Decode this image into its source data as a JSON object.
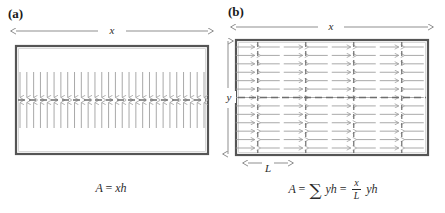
{
  "figure": {
    "type": "two-panel-schematic",
    "background_color": "#ffffff",
    "frame_color": "#555555",
    "arrow_color": "#8c8c8c",
    "dash_color": "#6e6e6e",
    "text_color": "#2b2b2b"
  },
  "panel_a": {
    "label": "(a)",
    "dimension_x_label": "x",
    "formula_A": "A",
    "formula_eq": "=",
    "formula_rhs": "xh",
    "frame": {
      "x": 16,
      "y": 46,
      "width": 192,
      "height": 108
    },
    "domain_count": 1,
    "arrow_count": 28,
    "arrow_orientation": "vertical-converging",
    "wall_orientation": "horizontal"
  },
  "panel_b": {
    "label": "(b)",
    "dimension_x_label": "x",
    "dimension_y_label": "y",
    "dimension_L_label": "L",
    "formula_A": "A",
    "formula_eq1": "=",
    "formula_sigma": "∑",
    "formula_term1": "yh",
    "formula_eq2": "=",
    "formula_frac_num": "x",
    "formula_frac_den": "L",
    "formula_term2": "yh",
    "frame": {
      "x": 236,
      "y": 40,
      "width": 192,
      "height": 115
    },
    "domain_count": 4,
    "rows_per_domain": 13,
    "arrow_orientation": "horizontal-converging",
    "wall_orientation": "vertical"
  },
  "chart_data": {
    "type": "diagram",
    "panels": [
      {
        "id": "a",
        "label": "(a)",
        "description": "Single magnetic domain with one horizontal domain wall; spins converge vertically on the wall",
        "equation": "A = xh",
        "domains": 1,
        "wall_length_relation": "x"
      },
      {
        "id": "b",
        "label": "(b)",
        "description": "Multiple magnetic domains of width L with vertical domain walls; spins converge horizontally on each wall",
        "equation": "A = ∑ yh = (x/L) yh",
        "domains": 4,
        "domain_width_symbol": "L",
        "domain_height_symbol": "y",
        "wall_count_relation": "x/L"
      }
    ]
  }
}
